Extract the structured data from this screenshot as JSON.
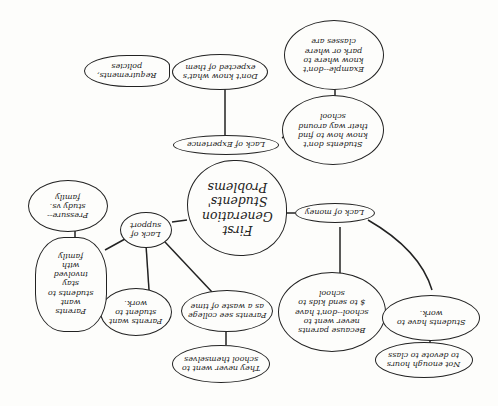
{
  "diagram": {
    "orientation": "rotated-180",
    "central": {
      "label": "First\nGeneration\nStudents'\nProblems"
    },
    "branches": [
      {
        "label": "Lack of Experience",
        "children": [
          {
            "label": "Don't know what's\nexpected of them",
            "children": [
              {
                "label": "Requirements,\npolicies"
              }
            ]
          },
          {
            "label": "Students don't\nknow how to find\ntheir way around\nschool",
            "children": [
              {
                "label": "Example--don't\nknow where to\npark or where\nclasses are"
              }
            ]
          }
        ]
      },
      {
        "label": "Lack of money",
        "children": [
          {
            "label": "Because parents\nnever went to\nschool--don't have\n$ to send kids to\nschool"
          },
          {
            "label": "Students have to\nwork.",
            "children": [
              {
                "label": "Not enough hours\nto devote to class"
              }
            ]
          }
        ]
      },
      {
        "label": "Lack of\nsupport",
        "children": [
          {
            "label": "Parents see college\nas a waste of time",
            "children": [
              {
                "label": "They never went to\nschool themselves"
              }
            ]
          },
          {
            "label": "Parents want\nstudent to\nwork."
          },
          {
            "label": "Parents\nwant\nstudents to\nstay\ninvolved\nwith\nfamily",
            "children": [
              {
                "label": "Pressure--\nstudy vs.\nfamily"
              }
            ]
          }
        ]
      }
    ]
  }
}
